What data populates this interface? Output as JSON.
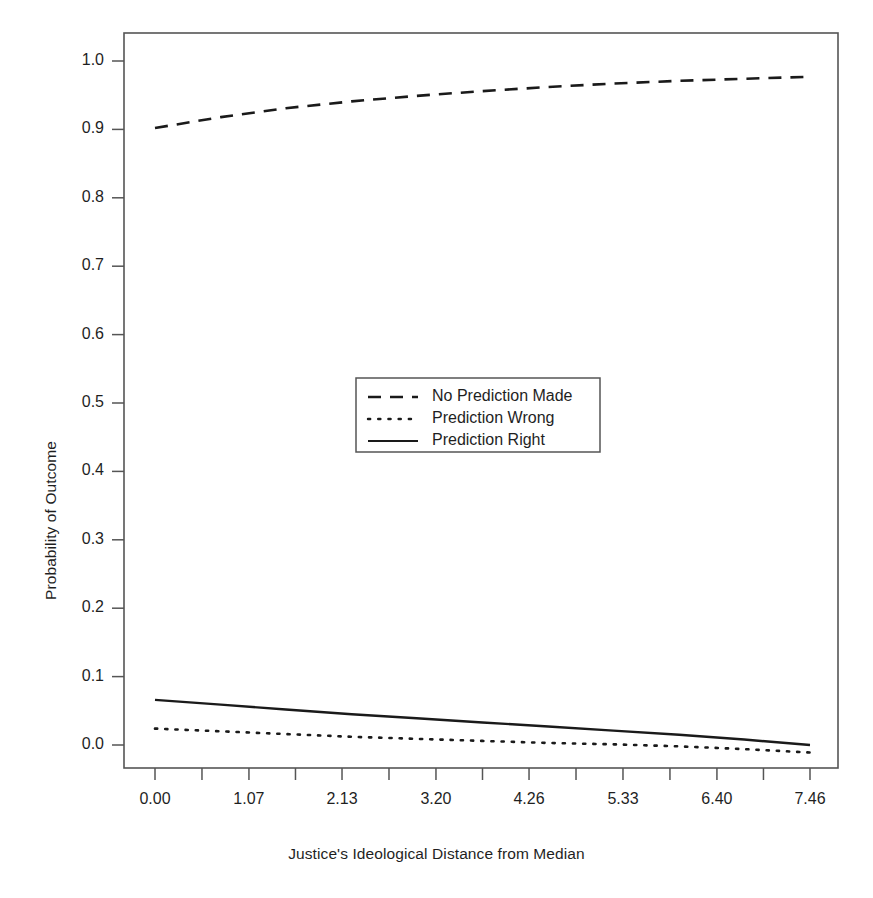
{
  "chart_data": {
    "type": "line",
    "title": "",
    "xlabel": "Justice's Ideological Distance from Median",
    "ylabel": "Probability of Outcome",
    "xlim": [
      0.0,
      7.46
    ],
    "ylim": [
      0.0,
      1.0
    ],
    "grid": false,
    "legend_position": "center",
    "xticks": [
      "0.00",
      "1.07",
      "2.13",
      "3.20",
      "4.26",
      "5.33",
      "6.40",
      "7.46"
    ],
    "xtick_values": [
      0.0,
      1.07,
      2.13,
      3.2,
      4.26,
      5.33,
      6.4,
      7.46
    ],
    "yticks": [
      "0.0",
      "0.1",
      "0.2",
      "0.3",
      "0.4",
      "0.5",
      "0.6",
      "0.7",
      "0.8",
      "0.9",
      "1.0"
    ],
    "ytick_values": [
      0.0,
      0.1,
      0.2,
      0.3,
      0.4,
      0.5,
      0.6,
      0.7,
      0.8,
      0.9,
      1.0
    ],
    "x": [
      0.0,
      0.75,
      1.49,
      2.24,
      2.98,
      3.73,
      4.48,
      5.22,
      5.97,
      6.71,
      7.46
    ],
    "series": [
      {
        "name": "No Prediction Made",
        "style": "dashed",
        "color": "#1a1a1a",
        "values": [
          0.902,
          0.918,
          0.931,
          0.941,
          0.949,
          0.956,
          0.962,
          0.967,
          0.971,
          0.974,
          0.977
        ]
      },
      {
        "name": "Prediction Wrong",
        "style": "dotted",
        "color": "#1a1a1a",
        "values": [
          0.024,
          0.02,
          0.016,
          0.012,
          0.009,
          0.006,
          0.003,
          0.001,
          -0.002,
          -0.006,
          -0.011
        ]
      },
      {
        "name": "Prediction Right",
        "style": "solid",
        "color": "#1a1a1a",
        "values": [
          0.066,
          0.059,
          0.052,
          0.045,
          0.039,
          0.033,
          0.027,
          0.021,
          0.015,
          0.008,
          0.0
        ]
      }
    ]
  },
  "axes": {
    "x_title": "Justice's Ideological Distance from Median",
    "y_title": "Probability of Outcome"
  },
  "legend": {
    "items": [
      {
        "label": "No Prediction Made",
        "style": "dashed"
      },
      {
        "label": "Prediction Wrong",
        "style": "dotted"
      },
      {
        "label": "Prediction Right",
        "style": "solid"
      }
    ]
  },
  "colors": {
    "line": "#1a1a1a",
    "frame": "#555555",
    "background": "#ffffff"
  }
}
